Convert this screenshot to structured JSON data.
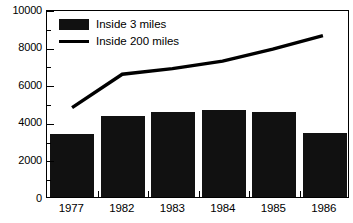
{
  "chart_data": {
    "type": "bar",
    "title": "",
    "xlabel": "",
    "ylabel": "",
    "categories": [
      "1977",
      "1982",
      "1983",
      "1984",
      "1985",
      "1986"
    ],
    "ylim": [
      0,
      10000
    ],
    "ytick_labels": [
      "0",
      "2000",
      "4000",
      "6000",
      "8000",
      "10000"
    ],
    "ytick_values": [
      0,
      2000,
      4000,
      6000,
      8000,
      10000
    ],
    "yminor_values": [
      1000,
      3000,
      5000,
      7000,
      9000
    ],
    "grid": false,
    "legend_position": "top-left",
    "series": [
      {
        "name": "Inside 3 miles",
        "type": "bar",
        "color": "#111111",
        "values": [
          3350,
          4300,
          4530,
          4630,
          4520,
          3420
        ]
      },
      {
        "name": "Inside 200 miles",
        "type": "line",
        "color": "#000000",
        "values": [
          4800,
          6600,
          6900,
          7300,
          7950,
          8670
        ]
      }
    ]
  },
  "legend": {
    "items": [
      {
        "label": "Inside 3 miles",
        "swatch": "bar-swatch"
      },
      {
        "label": "Inside 200 miles",
        "swatch": "line-swatch"
      }
    ]
  }
}
